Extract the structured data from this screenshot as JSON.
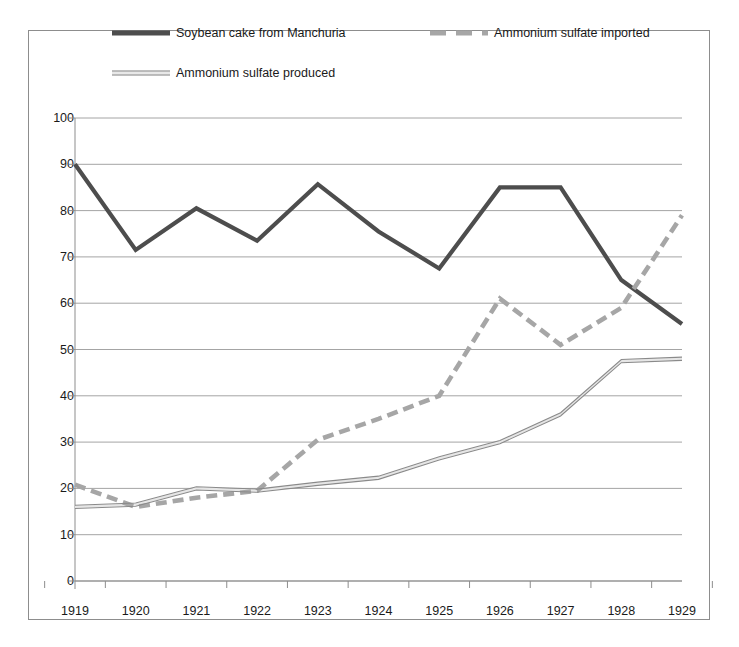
{
  "chart_data": {
    "type": "line",
    "title": "",
    "xlabel": "",
    "ylabel": "",
    "categories": [
      "1919",
      "1920",
      "1921",
      "1922",
      "1923",
      "1924",
      "1925",
      "1926",
      "1927",
      "1928",
      "1929"
    ],
    "x": [
      1919,
      1920,
      1921,
      1922,
      1923,
      1924,
      1925,
      1926,
      1927,
      1928,
      1929
    ],
    "ylim": [
      0,
      100
    ],
    "ytick_labels": [
      "0",
      "10",
      "20",
      "30",
      "40",
      "50",
      "60",
      "70",
      "80",
      "90",
      "100"
    ],
    "yticks": [
      0,
      10,
      20,
      30,
      40,
      50,
      60,
      70,
      80,
      90,
      100
    ],
    "grid": true,
    "legend_position": "top",
    "series": [
      {
        "name": "Soybean cake from Manchuria",
        "style": "solid-thick",
        "color": "#4d4d4d",
        "values": [
          90,
          71.5,
          80.5,
          73.5,
          85.7,
          75.5,
          67.5,
          85,
          85,
          65,
          55.5
        ]
      },
      {
        "name": "Ammonium sulfate imported",
        "style": "dashed",
        "color": "#a6a6a6",
        "values": [
          20.8,
          16,
          18,
          19.5,
          30.5,
          35,
          40,
          61,
          51,
          59,
          79
        ]
      },
      {
        "name": "Ammonium sulfate produced",
        "style": "thin-double",
        "color": "#8a8a8a",
        "values": [
          16,
          16.5,
          20,
          19.5,
          21,
          22.3,
          26.5,
          30,
          36,
          47.5,
          48
        ]
      }
    ]
  },
  "legend": {
    "entries": [
      {
        "label": "Soybean cake from Manchuria",
        "marker": "solid-thick-line-swatch"
      },
      {
        "label": "Ammonium sulfate imported",
        "marker": "dashed-line-swatch"
      },
      {
        "label": "Ammonium sulfate produced",
        "marker": "thin-double-line-swatch"
      }
    ]
  },
  "colors": {
    "series_soybean": "#4d4d4d",
    "series_imported": "#a6a6a6",
    "series_produced": "#8a8a8a",
    "gridline": "#9a9a9a",
    "axis": "#8d8d8d",
    "border": "#8d8d8d",
    "text": "#1a1a1a",
    "background": "#ffffff"
  }
}
